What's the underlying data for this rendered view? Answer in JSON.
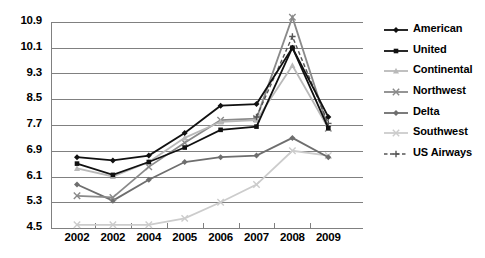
{
  "chart_data": {
    "type": "line",
    "title": "",
    "xlabel": "",
    "ylabel": "",
    "x": [
      "2002",
      "2002",
      "2004",
      "2005",
      "2006",
      "2007",
      "2008",
      "2009"
    ],
    "categories": [
      "2002",
      "2002",
      "2004",
      "2005",
      "2006",
      "2007",
      "2008",
      "2009"
    ],
    "yticks": [
      4.5,
      5.3,
      6.1,
      6.9,
      7.7,
      8.5,
      9.3,
      10.1,
      10.9
    ],
    "ytick_labels": [
      "4.5",
      "5.3",
      "6.1",
      "6.9",
      "7.7",
      "8.5",
      "9.3",
      "10.1",
      "10.9"
    ],
    "ylim": [
      4.5,
      10.9
    ],
    "grid": true,
    "legend_position": "right",
    "series": [
      {
        "name": "American",
        "color": "#111111",
        "marker": "diamond",
        "dash": "solid",
        "values": [
          6.7,
          6.6,
          6.75,
          7.45,
          8.3,
          8.35,
          10.1,
          7.95
        ]
      },
      {
        "name": "United",
        "color": "#111111",
        "marker": "square",
        "dash": "solid",
        "values": [
          6.5,
          6.15,
          6.55,
          7.0,
          7.55,
          7.65,
          10.1,
          7.6
        ]
      },
      {
        "name": "Continental",
        "color": "#b9b9b9",
        "marker": "triangle",
        "dash": "solid",
        "values": [
          6.35,
          6.1,
          6.55,
          7.3,
          7.8,
          7.85,
          9.55,
          7.6
        ]
      },
      {
        "name": "Northwest",
        "color": "#8a8a8a",
        "marker": "x",
        "dash": "solid",
        "values": [
          5.5,
          5.45,
          6.4,
          7.15,
          7.85,
          7.9,
          11.05,
          7.6
        ]
      },
      {
        "name": "Delta",
        "color": "#6e6e6e",
        "marker": "diamond",
        "dash": "solid",
        "values": [
          5.85,
          5.35,
          6.0,
          6.55,
          6.7,
          6.75,
          7.3,
          6.7
        ]
      },
      {
        "name": "Southwest",
        "color": "#cccccc",
        "marker": "x",
        "dash": "solid",
        "values": [
          4.6,
          4.6,
          4.6,
          4.8,
          5.3,
          5.85,
          6.9,
          6.75
        ]
      },
      {
        "name": "US Airways",
        "color": "#555555",
        "marker": "plus",
        "dash": "dashed",
        "values": [
          null,
          null,
          null,
          null,
          null,
          7.95,
          10.45,
          7.75
        ]
      }
    ]
  },
  "legend": {
    "items": [
      {
        "label": "American"
      },
      {
        "label": "United"
      },
      {
        "label": "Continental"
      },
      {
        "label": "Northwest"
      },
      {
        "label": "Delta"
      },
      {
        "label": "Southwest"
      },
      {
        "label": "US Airways"
      }
    ]
  }
}
